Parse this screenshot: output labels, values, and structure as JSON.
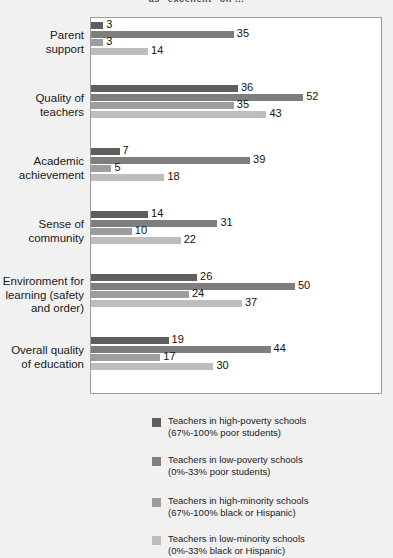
{
  "chart_data": {
    "type": "bar",
    "orientation": "horizontal",
    "title": "as  \"excellent\"  on ...",
    "xlabel": "",
    "ylabel": "",
    "xlim": [
      0,
      55
    ],
    "grid": false,
    "legend_position": "bottom",
    "categories": [
      "Parent support",
      "Quality of teachers",
      "Academic achievement",
      "Sense of community",
      "Environment for learning (safety and order)",
      "Overall quality of education"
    ],
    "series": [
      {
        "name": "Teachers in high-poverty schools (67%-100% poor students)",
        "color": "#5e5e5e",
        "values": [
          3,
          36,
          7,
          14,
          26,
          19
        ]
      },
      {
        "name": "Teachers in low-poverty schools (0%-33% poor students)",
        "color": "#7e7e7e",
        "values": [
          35,
          52,
          39,
          31,
          50,
          44
        ]
      },
      {
        "name": "Teachers in high-minority schools (67%-100% black or Hispanic)",
        "color": "#9d9d9d",
        "values": [
          3,
          35,
          5,
          10,
          24,
          17
        ]
      },
      {
        "name": "Teachers in low-minority schools (0%-33% black or Hispanic)",
        "color": "#bdbdbd",
        "values": [
          14,
          43,
          18,
          22,
          37,
          30
        ]
      }
    ]
  },
  "category_labels": [
    [
      "Parent",
      "support"
    ],
    [
      "Quality of",
      "teachers"
    ],
    [
      "Academic",
      "achievement"
    ],
    [
      "Sense of",
      "community"
    ],
    [
      "Environment for",
      "learning (safety",
      "and order)"
    ],
    [
      "Overall quality",
      "of education"
    ]
  ],
  "legend": [
    {
      "line1": "Teachers in high-poverty schools",
      "line2": "(67%-100% poor students)",
      "color": "#5e5e5e"
    },
    {
      "line1": "Teachers in low-poverty schools",
      "line2": "(0%-33% poor students)",
      "color": "#7e7e7e"
    },
    {
      "line1": "Teachers in high-minority schools",
      "line2": "(67%-100% black or Hispanic)",
      "color": "#9d9d9d"
    },
    {
      "line1": "Teachers in low-minority schools",
      "line2": "(0%-33% black or Hispanic)",
      "color": "#bdbdbd"
    }
  ],
  "colors": {
    "background": "#f1f1f1",
    "plot_background": "#ffffff",
    "frame": "#9c9c9c",
    "text": "#1a1a1a"
  }
}
